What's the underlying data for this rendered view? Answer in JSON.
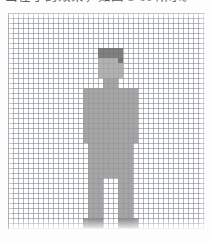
{
  "caption": {
    "text": "出在子的效果，如图 3-66 所示。",
    "visible_note": "partially cropped line of text at very top of image"
  },
  "grid": {
    "cell_size_px": 5,
    "cols": 39,
    "rows": 43,
    "line_color": "#767c86",
    "paper_color": "#ffffff"
  },
  "figure": {
    "name": "pixel-art human figure",
    "colors": {
      "hair": "#6e6e6e",
      "skin": "#a6a6a6",
      "body": "#989898",
      "shoe": "#8c8c8c"
    },
    "parts": [
      {
        "name": "hair",
        "color": "#6e6e6e",
        "x": 18,
        "y": 7,
        "w": 5,
        "h": 2
      },
      {
        "name": "face",
        "color": "#a6a6a6",
        "x": 18,
        "y": 9,
        "w": 5,
        "h": 4
      },
      {
        "name": "hair-side",
        "color": "#6e6e6e",
        "x": 22,
        "y": 9,
        "w": 1,
        "h": 1
      },
      {
        "name": "neck",
        "color": "#989898",
        "x": 19,
        "y": 13,
        "w": 3,
        "h": 2
      },
      {
        "name": "shoulders",
        "color": "#989898",
        "x": 15,
        "y": 15,
        "w": 11,
        "h": 2
      },
      {
        "name": "torso",
        "color": "#989898",
        "x": 16,
        "y": 17,
        "w": 9,
        "h": 13
      },
      {
        "name": "arm-left",
        "color": "#989898",
        "x": 15,
        "y": 17,
        "w": 1,
        "h": 9
      },
      {
        "name": "arm-right",
        "color": "#989898",
        "x": 25,
        "y": 17,
        "w": 1,
        "h": 9
      },
      {
        "name": "hips",
        "color": "#989898",
        "x": 16,
        "y": 30,
        "w": 9,
        "h": 3
      },
      {
        "name": "leg-left",
        "color": "#989898",
        "x": 16,
        "y": 33,
        "w": 3,
        "h": 10
      },
      {
        "name": "leg-right",
        "color": "#989898",
        "x": 22,
        "y": 33,
        "w": 3,
        "h": 10
      },
      {
        "name": "shoe-left",
        "color": "#8c8c8c",
        "x": 15,
        "y": 41,
        "w": 4,
        "h": 2
      },
      {
        "name": "shoe-right",
        "color": "#8c8c8c",
        "x": 22,
        "y": 41,
        "w": 4,
        "h": 2
      }
    ]
  }
}
